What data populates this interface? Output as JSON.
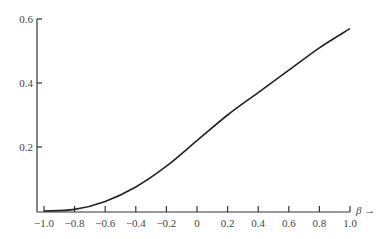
{
  "chart_data": {
    "type": "line",
    "title": "",
    "xlabel": "β →",
    "ylabel": "",
    "xlim": [
      -1.0,
      1.0
    ],
    "ylim": [
      0,
      0.6
    ],
    "grid": false,
    "x_ticks": [
      "-1.0",
      "-0.8",
      "-0.6",
      "-0.4",
      "-0.2",
      "0",
      "0.2",
      "0.4",
      "0.6",
      "0.8",
      "1.0"
    ],
    "y_ticks": [
      "0.2",
      "0.4",
      "0.6"
    ],
    "series": [
      {
        "name": "curve",
        "x": [
          -1.0,
          -0.8,
          -0.6,
          -0.4,
          -0.2,
          0.0,
          0.2,
          0.4,
          0.6,
          0.8,
          1.0
        ],
        "y": [
          0.0,
          0.005,
          0.03,
          0.075,
          0.14,
          0.22,
          0.3,
          0.37,
          0.44,
          0.51,
          0.57
        ]
      }
    ]
  }
}
